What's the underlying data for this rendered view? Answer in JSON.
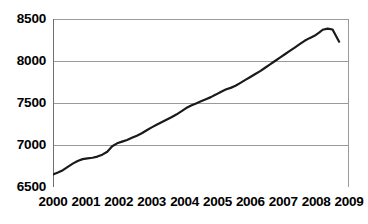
{
  "chart_data": {
    "type": "line",
    "title": "",
    "subtitle": "",
    "xlabel": "",
    "ylabel": "",
    "xlim": [
      2000,
      2009
    ],
    "ylim": [
      6500,
      8500
    ],
    "grid": true,
    "legend": null,
    "legend_position": "none",
    "x_tick_labels": [
      "2000",
      "2001",
      "2002",
      "2003",
      "2004",
      "2005",
      "2006",
      "2007",
      "2008",
      "2009"
    ],
    "x_ticks": [
      2000,
      2001,
      2002,
      2003,
      2004,
      2005,
      2006,
      2007,
      2008,
      2009
    ],
    "y_tick_labels": [
      "6500",
      "7000",
      "7500",
      "8000",
      "8500"
    ],
    "y_ticks": [
      6500,
      7000,
      7500,
      8000,
      8500
    ],
    "line_color": "#1a1a1a",
    "line_width": 2.2,
    "grid_color": "#9a9a9a",
    "axis_color": "#808080",
    "background": "#ffffff",
    "series": [
      {
        "name": "series-1",
        "x": [
          2000.0,
          2000.15,
          2000.3,
          2000.45,
          2000.6,
          2000.75,
          2000.9,
          2001.05,
          2001.2,
          2001.35,
          2001.5,
          2001.65,
          2001.8,
          2001.95,
          2002.1,
          2002.25,
          2002.4,
          2002.55,
          2002.7,
          2002.85,
          2003.0,
          2003.15,
          2003.3,
          2003.45,
          2003.6,
          2003.75,
          2003.9,
          2004.05,
          2004.2,
          2004.35,
          2004.5,
          2004.65,
          2004.8,
          2004.95,
          2005.1,
          2005.25,
          2005.4,
          2005.55,
          2005.7,
          2005.85,
          2006.0,
          2006.15,
          2006.3,
          2006.45,
          2006.6,
          2006.75,
          2006.9,
          2007.05,
          2007.2,
          2007.35,
          2007.5,
          2007.65,
          2007.8,
          2007.95,
          2008.1,
          2008.2,
          2008.35,
          2008.5,
          2008.7
        ],
        "y": [
          6650,
          6672,
          6700,
          6740,
          6778,
          6810,
          6832,
          6840,
          6848,
          6862,
          6885,
          6920,
          6985,
          7020,
          7040,
          7060,
          7085,
          7110,
          7140,
          7175,
          7210,
          7240,
          7270,
          7300,
          7330,
          7362,
          7400,
          7440,
          7470,
          7495,
          7520,
          7545,
          7570,
          7600,
          7632,
          7660,
          7680,
          7705,
          7740,
          7775,
          7810,
          7845,
          7880,
          7920,
          7960,
          8000,
          8040,
          8080,
          8120,
          8160,
          8200,
          8240,
          8272,
          8300,
          8340,
          8372,
          8385,
          8375,
          8230
        ]
      }
    ]
  }
}
